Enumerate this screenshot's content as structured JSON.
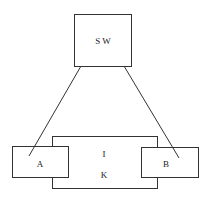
{
  "diagram": {
    "nodes": [
      {
        "id": "sw",
        "label": "S W",
        "x": 74,
        "y": 14,
        "w": 57,
        "h": 52
      },
      {
        "id": "ik",
        "label_top": "I",
        "label_bottom": "K",
        "x": 52,
        "y": 136,
        "w": 105,
        "h": 52
      },
      {
        "id": "a",
        "label": "A",
        "x": 12,
        "y": 146,
        "w": 56,
        "h": 31
      },
      {
        "id": "b",
        "label": "B",
        "x": 141,
        "y": 147,
        "w": 57,
        "h": 30
      }
    ],
    "edges": [
      {
        "from": "sw",
        "to": "a"
      },
      {
        "from": "sw",
        "to": "b"
      }
    ],
    "labels": {
      "sw": "S W",
      "ik_top": "I",
      "ik_bottom": "K",
      "a": "A",
      "b": "B"
    }
  }
}
